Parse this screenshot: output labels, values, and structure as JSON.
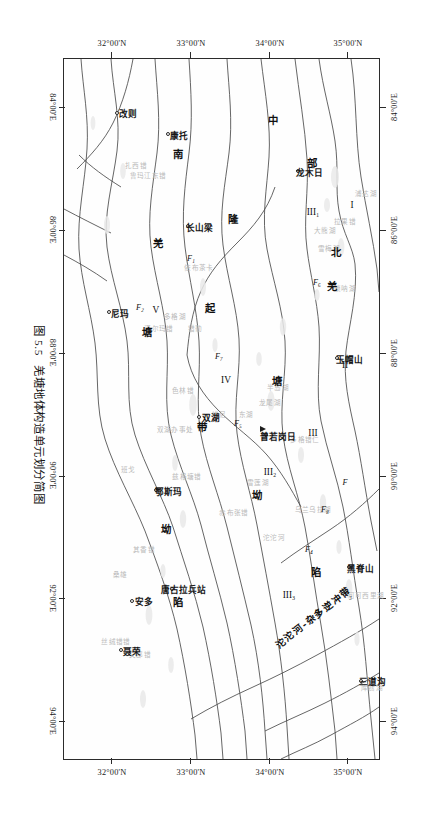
{
  "figure": {
    "caption_number": "图 5.5",
    "caption_title": "羌塘地体构造单元划分简图"
  },
  "axes": {
    "longitude_labels": [
      "84°00'E",
      "86°00'E",
      "88°00'E",
      "90°00'E",
      "92°00'E",
      "94°00'E"
    ],
    "longitude_values": [
      84,
      86,
      88,
      90,
      92,
      94
    ],
    "latitude_labels": [
      "32°00'N",
      "33°00'N",
      "34°00'N",
      "35°00'N"
    ],
    "latitude_values": [
      32,
      33,
      34,
      35
    ],
    "lon_range": [
      83.2,
      94.6
    ],
    "lat_range": [
      31.4,
      35.4
    ]
  },
  "map": {
    "cities": [
      {
        "name": "改则",
        "lon": 84.1,
        "lat": 32.05
      },
      {
        "name": "康托",
        "lon": 84.45,
        "lat": 32.7
      },
      {
        "name": "尼玛",
        "lon": 87.35,
        "lat": 31.95
      },
      {
        "name": "长山梁",
        "lon": 85.95,
        "lat": 32.95
      },
      {
        "name": "双湖",
        "lon": 89.05,
        "lat": 33.1
      },
      {
        "name": "龙木日",
        "lon": 85.05,
        "lat": 34.35
      },
      {
        "name": "普若岗日",
        "lon": 89.35,
        "lat": 33.95
      },
      {
        "name": "玉帽山",
        "lon": 88.1,
        "lat": 34.85
      },
      {
        "name": "黑脊山",
        "lon": 91.5,
        "lat": 35.0
      },
      {
        "name": "三道沟",
        "lon": 93.35,
        "lat": 35.15
      },
      {
        "name": "唐古拉兵站",
        "lon": 91.85,
        "lat": 32.75
      },
      {
        "name": "鄂斯玛",
        "lon": 90.25,
        "lat": 32.55
      },
      {
        "name": "安多",
        "lon": 92.05,
        "lat": 32.25
      },
      {
        "name": "聂荣",
        "lon": 92.85,
        "lat": 32.1
      }
    ],
    "peaks": [
      {
        "name": "普若岗日",
        "lon": 89.25,
        "lat": 33.92
      }
    ],
    "tectonic_units": [
      {
        "label": "I",
        "lon": 85.6,
        "lat": 35.05
      },
      {
        "label": "II",
        "lon": 88.2,
        "lat": 34.95
      },
      {
        "label": "III",
        "lon": 89.3,
        "lat": 34.55
      },
      {
        "label": "III₁",
        "lon": 85.7,
        "lat": 34.55
      },
      {
        "label": "III₂",
        "lon": 89.95,
        "lat": 34.0
      },
      {
        "label": "III₃",
        "lon": 91.95,
        "lat": 34.25
      },
      {
        "label": "IV",
        "lon": 88.45,
        "lat": 33.45
      },
      {
        "label": "V",
        "lon": 87.3,
        "lat": 32.55
      }
    ],
    "faults": [
      {
        "label": "F",
        "lon": 90.1,
        "lat": 34.95
      },
      {
        "label": "F₈",
        "lon": 90.55,
        "lat": 34.7
      },
      {
        "label": "F₆",
        "lon": 86.85,
        "lat": 34.6
      },
      {
        "label": "F₅",
        "lon": 89.15,
        "lat": 33.6
      },
      {
        "label": "F₄",
        "lon": 91.2,
        "lat": 34.5
      },
      {
        "label": "F₃",
        "lon": 91.95,
        "lat": 35.0
      },
      {
        "label": "F₁",
        "lon": 86.45,
        "lat": 33.0
      },
      {
        "label": "F₂",
        "lon": 87.25,
        "lat": 32.35
      },
      {
        "label": "F₇",
        "lon": 88.05,
        "lat": 33.35
      }
    ],
    "region_names": [
      {
        "text": "中",
        "lon": 84.2,
        "lat": 34.05
      },
      {
        "text": "部",
        "lon": 84.9,
        "lat": 34.55
      },
      {
        "text": "北",
        "lon": 86.35,
        "lat": 34.85
      },
      {
        "text": "羌",
        "lon": 86.9,
        "lat": 34.8
      },
      {
        "text": "塘",
        "lon": 88.45,
        "lat": 34.1
      },
      {
        "text": "隆",
        "lon": 85.8,
        "lat": 33.55
      },
      {
        "text": "起",
        "lon": 87.25,
        "lat": 33.25
      },
      {
        "text": "坳",
        "lon": 90.3,
        "lat": 33.85
      },
      {
        "text": "陷",
        "lon": 91.55,
        "lat": 34.6
      },
      {
        "text": "带",
        "lon": 89.2,
        "lat": 33.15
      },
      {
        "text": "南",
        "lon": 84.75,
        "lat": 32.85
      },
      {
        "text": "羌",
        "lon": 86.2,
        "lat": 32.6
      },
      {
        "text": "塘",
        "lon": 87.65,
        "lat": 32.45
      },
      {
        "text": "坳",
        "lon": 90.85,
        "lat": 32.7
      },
      {
        "text": "陷",
        "lon": 92.05,
        "lat": 32.85
      }
    ],
    "belts": [
      {
        "text": "沱沱河-杂多逆冲带",
        "lon": 92.3,
        "lat": 34.55,
        "angle": -38
      }
    ],
    "faint_features": [
      {
        "text": "库赛湖",
        "lon": 93.45,
        "lat": 35.3
      },
      {
        "text": "可可西里湖",
        "lon": 91.95,
        "lat": 35.22
      },
      {
        "text": "沱沱河",
        "lon": 91.0,
        "lat": 34.05
      },
      {
        "text": "乌兰乌拉湖",
        "lon": 90.55,
        "lat": 34.55
      },
      {
        "text": "雪莲湖",
        "lon": 90.1,
        "lat": 33.85
      },
      {
        "text": "赤布张错",
        "lon": 90.6,
        "lat": 33.55
      },
      {
        "text": "多格错仁",
        "lon": 89.4,
        "lat": 34.45
      },
      {
        "text": "半岛湖",
        "lon": 88.55,
        "lat": 34.1
      },
      {
        "text": "龙尾湖",
        "lon": 88.8,
        "lat": 34.0
      },
      {
        "text": "东湖",
        "lon": 89.0,
        "lat": 33.7
      },
      {
        "text": "兹格塘错",
        "lon": 90.0,
        "lat": 32.95
      },
      {
        "text": "错尼",
        "lon": 89.0,
        "lat": 33.35
      },
      {
        "text": "色林错",
        "lon": 88.6,
        "lat": 32.9
      },
      {
        "text": "其香错",
        "lon": 91.2,
        "lat": 32.4
      },
      {
        "text": "双湖办事处",
        "lon": 89.25,
        "lat": 32.8
      },
      {
        "text": "错勤",
        "lon": 87.6,
        "lat": 33.05
      },
      {
        "text": "班戈",
        "lon": 89.9,
        "lat": 32.2
      },
      {
        "text": "依布茶卡",
        "lon": 86.6,
        "lat": 33.1
      },
      {
        "text": "诺尔玛错",
        "lon": 87.6,
        "lat": 32.6
      },
      {
        "text": "多格湖",
        "lon": 87.4,
        "lat": 32.8
      },
      {
        "text": "扎西错",
        "lon": 84.95,
        "lat": 32.3
      },
      {
        "text": "鲁玛江东错",
        "lon": 85.1,
        "lat": 32.45
      },
      {
        "text": "唢呐湖",
        "lon": 86.95,
        "lat": 34.95
      },
      {
        "text": "拉果错",
        "lon": 85.85,
        "lat": 34.95
      },
      {
        "text": "雪梅湖",
        "lon": 86.3,
        "lat": 34.75
      },
      {
        "text": "大熊湖",
        "lon": 86.0,
        "lat": 34.7
      },
      {
        "text": "浦达湖",
        "lon": 85.4,
        "lat": 35.22
      },
      {
        "text": "文部错",
        "lon": 92.9,
        "lat": 32.35
      },
      {
        "text": "丝绒错错",
        "lon": 92.7,
        "lat": 32.05
      },
      {
        "text": "桑雄",
        "lon": 91.6,
        "lat": 32.1
      }
    ]
  },
  "colors": {
    "frame": "#2b2b2b",
    "boundary": "#4a4a4a",
    "faint_text": "#b9b9b9",
    "label_text": "#111111",
    "background": "#ffffff"
  }
}
